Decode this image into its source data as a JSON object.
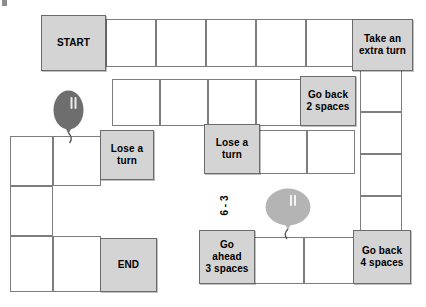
{
  "board": {
    "title": "Board Game Path",
    "background_color": "#ffffff",
    "special_cell_color": "#d4d4d4",
    "plain_cell_color": "#ffffff",
    "border_color": "#7d7d7d",
    "special_cells": [
      {
        "id": "start",
        "label": "START",
        "x": 41,
        "y": 15,
        "w": 65,
        "h": 56
      },
      {
        "id": "take-extra-turn",
        "label": "Take an\nextra turn",
        "x": 352,
        "y": 19,
        "w": 61,
        "h": 52
      },
      {
        "id": "go-back-2",
        "label": "Go back\n2 spaces",
        "x": 300,
        "y": 76,
        "w": 56,
        "h": 50
      },
      {
        "id": "lose-turn-left",
        "label": "Lose a\nturn",
        "x": 100,
        "y": 130,
        "w": 54,
        "h": 50
      },
      {
        "id": "lose-turn-middle",
        "label": "Lose a\nturn",
        "x": 204,
        "y": 124,
        "w": 56,
        "h": 50
      },
      {
        "id": "end",
        "label": "END",
        "x": 100,
        "y": 238,
        "w": 57,
        "h": 54
      },
      {
        "id": "go-ahead-3",
        "label": "Go\nahead\n3 spaces",
        "x": 199,
        "y": 230,
        "w": 56,
        "h": 54
      },
      {
        "id": "go-back-4",
        "label": "Go back\n4 spaces",
        "x": 353,
        "y": 230,
        "w": 58,
        "h": 54
      }
    ],
    "plain_cells": [
      {
        "id": "top-1",
        "x": 106,
        "y": 19,
        "w": 50,
        "h": 48
      },
      {
        "id": "top-2",
        "x": 156,
        "y": 19,
        "w": 50,
        "h": 48
      },
      {
        "id": "top-3",
        "x": 206,
        "y": 19,
        "w": 50,
        "h": 48
      },
      {
        "id": "top-4",
        "x": 256,
        "y": 19,
        "w": 50,
        "h": 48
      },
      {
        "id": "top-5",
        "x": 306,
        "y": 19,
        "w": 48,
        "h": 48
      },
      {
        "id": "row2-1",
        "x": 112,
        "y": 79,
        "w": 48,
        "h": 47
      },
      {
        "id": "row2-2",
        "x": 160,
        "y": 79,
        "w": 48,
        "h": 47
      },
      {
        "id": "row2-3",
        "x": 208,
        "y": 79,
        "w": 48,
        "h": 47
      },
      {
        "id": "row2-4",
        "x": 256,
        "y": 79,
        "w": 46,
        "h": 47
      },
      {
        "id": "right-col-1",
        "x": 360,
        "y": 70,
        "w": 42,
        "h": 42
      },
      {
        "id": "right-col-2",
        "x": 360,
        "y": 112,
        "w": 42,
        "h": 42
      },
      {
        "id": "right-col-3",
        "x": 360,
        "y": 154,
        "w": 42,
        "h": 42
      },
      {
        "id": "right-col-4",
        "x": 360,
        "y": 196,
        "w": 42,
        "h": 40
      },
      {
        "id": "mid-right-1",
        "x": 259,
        "y": 130,
        "w": 48,
        "h": 44
      },
      {
        "id": "mid-right-2",
        "x": 307,
        "y": 130,
        "w": 48,
        "h": 44
      },
      {
        "id": "left-col-1",
        "x": 10,
        "y": 136,
        "w": 43,
        "h": 50
      },
      {
        "id": "left-col-2",
        "x": 10,
        "y": 186,
        "w": 43,
        "h": 50
      },
      {
        "id": "left-col-3",
        "x": 10,
        "y": 236,
        "w": 43,
        "h": 56
      },
      {
        "id": "left-mid-1",
        "x": 53,
        "y": 136,
        "w": 48,
        "h": 50
      },
      {
        "id": "left-mid-2",
        "x": 53,
        "y": 236,
        "w": 48,
        "h": 56
      },
      {
        "id": "bottom-1",
        "x": 254,
        "y": 237,
        "w": 50,
        "h": 47
      },
      {
        "id": "bottom-2",
        "x": 304,
        "y": 237,
        "w": 50,
        "h": 47
      }
    ],
    "rotated_labels": [
      {
        "id": "dice-subtraction",
        "text": "6 - 3",
        "x": 214,
        "y": 200
      }
    ],
    "balloons": [
      {
        "id": "balloon-dark",
        "color": "#6e6e6e",
        "x": 53,
        "y": 90,
        "w": 31,
        "h": 40,
        "shape": "oval-tall"
      },
      {
        "id": "balloon-light",
        "color": "#b4b4b4",
        "x": 265,
        "y": 188,
        "w": 46,
        "h": 38,
        "shape": "oval-wide"
      }
    ],
    "corner_marks": [
      {
        "id": "top-left-tick",
        "x": 2,
        "y": 0,
        "w": 5,
        "h": 6
      }
    ]
  }
}
